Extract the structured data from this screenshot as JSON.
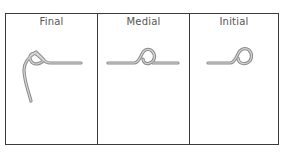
{
  "diagram": {
    "type": "letterform-positions",
    "columns": [
      {
        "label": "Final",
        "glyph": "final-form"
      },
      {
        "label": "Medial",
        "glyph": "medial-form"
      },
      {
        "label": "Initial",
        "glyph": "initial-form"
      }
    ],
    "colors": {
      "border": "#3a3a3a",
      "glyph": "#8a8a8a",
      "label": "#555555"
    }
  }
}
